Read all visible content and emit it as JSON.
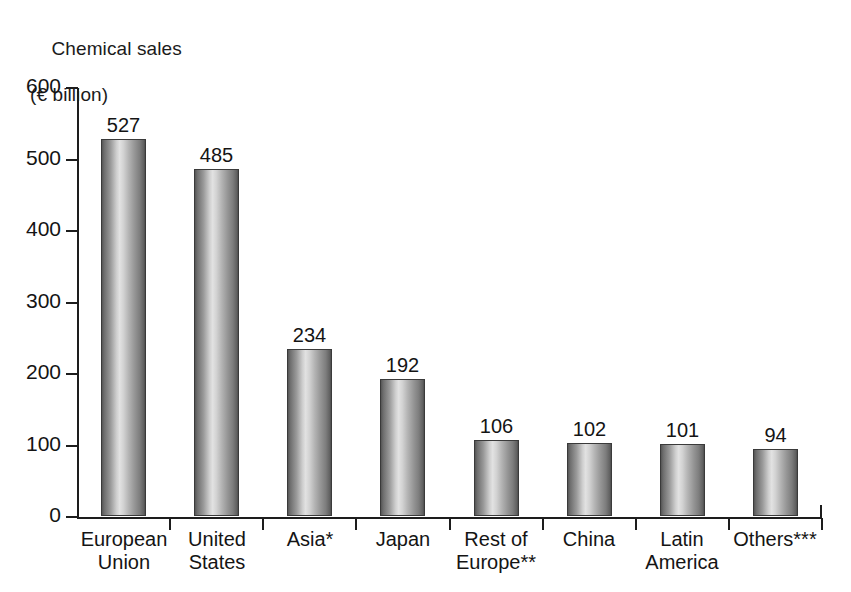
{
  "chart_data": {
    "type": "bar",
    "title": "Chemical sales (€ billion)",
    "title_line1": "Chemical sales",
    "title_line2": "(€ billion)",
    "xlabel": "",
    "ylabel": "Chemical sales (€ billion)",
    "ylim": [
      0,
      600
    ],
    "yticks": [
      600,
      500,
      400,
      300,
      200,
      100,
      0
    ],
    "ytick_labels": [
      "600",
      "500",
      "400",
      "300",
      "200",
      "100",
      "0"
    ],
    "grid": false,
    "legend": "none",
    "bar_style": "vertical-gradient-fill",
    "categories": [
      "European Union",
      "United States",
      "Asia*",
      "Japan",
      "Rest of Europe**",
      "China",
      "Latin America",
      "Others***"
    ],
    "category_lines": [
      [
        "European",
        "Union"
      ],
      [
        "United",
        "States"
      ],
      [
        "Asia*",
        ""
      ],
      [
        "Japan",
        ""
      ],
      [
        "Rest of",
        "Europe**"
      ],
      [
        "China",
        ""
      ],
      [
        "Latin",
        "America"
      ],
      [
        "Others***",
        ""
      ]
    ],
    "values": [
      527,
      485,
      234,
      192,
      106,
      102,
      101,
      94
    ],
    "value_labels": [
      "527",
      "485",
      "234",
      "192",
      "106",
      "102",
      "101",
      "94"
    ]
  },
  "colors": {
    "background": "#ffffff",
    "axis": "#1d1d1d",
    "text": "#141414",
    "bar_dark": "#555555",
    "bar_light": "#e2e2e2"
  }
}
